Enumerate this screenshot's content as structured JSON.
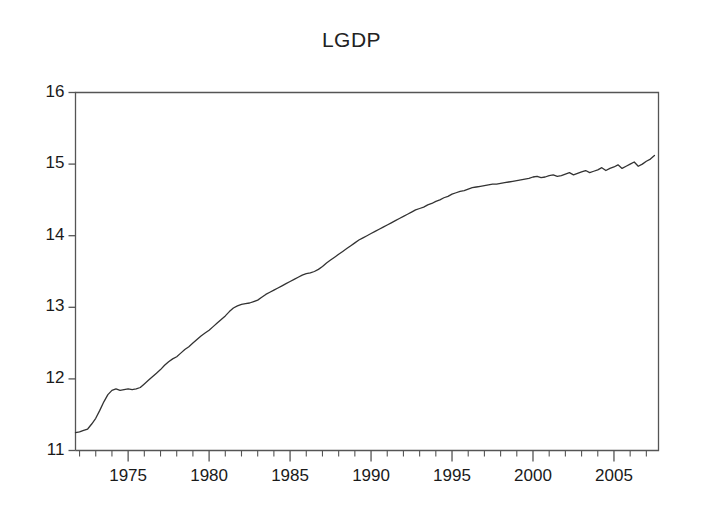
{
  "chart_data": {
    "type": "line",
    "title": "LGDP",
    "xlabel": "",
    "ylabel": "",
    "xlim": [
      1971.75,
      2007.75
    ],
    "ylim": [
      11,
      16
    ],
    "grid": false,
    "legend": "none",
    "y_ticks": [
      "11",
      "12",
      "13",
      "14",
      "15",
      "16"
    ],
    "y_tick_values": [
      11,
      12,
      13,
      14,
      15,
      16
    ],
    "x_ticks": [
      "1975",
      "1980",
      "1985",
      "1990",
      "1995",
      "2000",
      "2005"
    ],
    "x_tick_values": [
      1975,
      1980,
      1985,
      1990,
      1995,
      2000,
      2005
    ],
    "x_minor_tick_step": 1,
    "line_color": "#333333",
    "axis_color": "#555555",
    "series": [
      {
        "name": "LGDP",
        "x": [
          1971.75,
          1972.0,
          1972.25,
          1972.5,
          1972.75,
          1973.0,
          1973.25,
          1973.5,
          1973.75,
          1974.0,
          1974.25,
          1974.5,
          1974.75,
          1975.0,
          1975.25,
          1975.5,
          1975.75,
          1976.0,
          1976.25,
          1976.5,
          1976.75,
          1977.0,
          1977.25,
          1977.5,
          1977.75,
          1978.0,
          1978.25,
          1978.5,
          1978.75,
          1979.0,
          1979.25,
          1979.5,
          1979.75,
          1980.0,
          1980.25,
          1980.5,
          1980.75,
          1981.0,
          1981.25,
          1981.5,
          1981.75,
          1982.0,
          1982.25,
          1982.5,
          1982.75,
          1983.0,
          1983.25,
          1983.5,
          1983.75,
          1984.0,
          1984.25,
          1984.5,
          1984.75,
          1985.0,
          1985.25,
          1985.5,
          1985.75,
          1986.0,
          1986.25,
          1986.5,
          1986.75,
          1987.0,
          1987.25,
          1987.5,
          1987.75,
          1988.0,
          1988.25,
          1988.5,
          1988.75,
          1989.0,
          1989.25,
          1989.5,
          1989.75,
          1990.0,
          1990.25,
          1990.5,
          1990.75,
          1991.0,
          1991.25,
          1991.5,
          1991.75,
          1992.0,
          1992.25,
          1992.5,
          1992.75,
          1993.0,
          1993.25,
          1993.5,
          1993.75,
          1994.0,
          1994.25,
          1994.5,
          1994.75,
          1995.0,
          1995.25,
          1995.5,
          1995.75,
          1996.0,
          1996.25,
          1996.5,
          1996.75,
          1997.0,
          1997.25,
          1997.5,
          1997.75,
          1998.0,
          1998.25,
          1998.5,
          1998.75,
          1999.0,
          1999.25,
          1999.5,
          1999.75,
          2000.0,
          2000.25,
          2000.5,
          2000.75,
          2001.0,
          2001.25,
          2001.5,
          2001.75,
          2002.0,
          2002.25,
          2002.5,
          2002.75,
          2003.0,
          2003.25,
          2003.5,
          2003.75,
          2004.0,
          2004.25,
          2004.5,
          2004.75,
          2005.0,
          2005.25,
          2005.5,
          2005.75,
          2006.0,
          2006.25,
          2006.5,
          2006.75,
          2007.0,
          2007.25,
          2007.5
        ],
        "values": [
          11.25,
          11.26,
          11.28,
          11.3,
          11.37,
          11.45,
          11.56,
          11.68,
          11.78,
          11.84,
          11.86,
          11.84,
          11.85,
          11.86,
          11.85,
          11.86,
          11.88,
          11.93,
          11.98,
          12.03,
          12.08,
          12.13,
          12.19,
          12.24,
          12.28,
          12.31,
          12.36,
          12.41,
          12.45,
          12.5,
          12.55,
          12.6,
          12.64,
          12.68,
          12.73,
          12.78,
          12.83,
          12.88,
          12.94,
          12.99,
          13.02,
          13.04,
          13.05,
          13.06,
          13.08,
          13.1,
          13.14,
          13.18,
          13.21,
          13.24,
          13.27,
          13.3,
          13.33,
          13.36,
          13.39,
          13.42,
          13.45,
          13.47,
          13.48,
          13.5,
          13.53,
          13.57,
          13.62,
          13.66,
          13.7,
          13.74,
          13.78,
          13.82,
          13.86,
          13.9,
          13.94,
          13.97,
          14.0,
          14.03,
          14.06,
          14.09,
          14.12,
          14.15,
          14.18,
          14.21,
          14.24,
          14.27,
          14.3,
          14.33,
          14.36,
          14.38,
          14.4,
          14.43,
          14.45,
          14.48,
          14.5,
          14.53,
          14.55,
          14.58,
          14.6,
          14.62,
          14.63,
          14.65,
          14.67,
          14.68,
          14.69,
          14.7,
          14.71,
          14.72,
          14.72,
          14.73,
          14.74,
          14.75,
          14.76,
          14.77,
          14.78,
          14.79,
          14.8,
          14.82,
          14.83,
          14.81,
          14.82,
          14.84,
          14.85,
          14.83,
          14.84,
          14.86,
          14.88,
          14.85,
          14.87,
          14.89,
          14.91,
          14.88,
          14.9,
          14.92,
          14.95,
          14.91,
          14.94,
          14.96,
          14.99,
          14.94,
          14.97,
          15.0,
          15.03,
          14.97,
          15.0,
          15.04,
          15.07,
          15.12
        ]
      }
    ]
  }
}
